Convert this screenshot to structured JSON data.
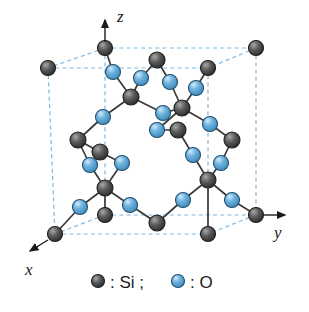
{
  "figure": {
    "background_color": "#ffffff"
  },
  "axes": {
    "x": {
      "label": "x",
      "direction": "down-left",
      "tip": [
        28,
        262
      ],
      "origin": [
        52,
        240
      ]
    },
    "y": {
      "label": "y",
      "direction": "right",
      "tip": [
        288,
        215
      ],
      "origin": [
        262,
        215
      ]
    },
    "z": {
      "label": "z",
      "direction": "up",
      "tip": [
        105,
        18
      ],
      "origin": [
        105,
        42
      ]
    }
  },
  "legend": {
    "si": {
      "symbol_color": "#4a4a4a",
      "label": ": Si ;"
    },
    "o": {
      "symbol_color": "#5aa8d8",
      "label": ": O"
    }
  },
  "colors": {
    "silicon": "#4a4a4a",
    "silicon_highlight": "#8e8e8e",
    "silicon_stroke": "#1f1f1f",
    "oxygen": "#5aa8d8",
    "oxygen_highlight": "#b8e0f5",
    "oxygen_stroke": "#1f4f70",
    "cell_edge": "#7fb8e0",
    "bond": "#3a3a3a"
  },
  "unit_cell": {
    "type": "dashed-cube",
    "edge_color": "#7fb8e0",
    "corners": {
      "back_top_left": [
        105,
        48
      ],
      "back_top_right": [
        256,
        48
      ],
      "front_top_left": [
        48,
        68
      ],
      "front_top_right": [
        208,
        68
      ],
      "back_bottom_left": [
        105,
        215
      ],
      "back_bottom_right": [
        256,
        215
      ],
      "front_bottom_left": [
        55,
        234
      ],
      "front_bottom_right": [
        208,
        234
      ]
    }
  },
  "atoms": {
    "silicon": [
      {
        "id": "si-corner-btl",
        "x": 105,
        "y": 48,
        "r": 7.5
      },
      {
        "id": "si-corner-btr",
        "x": 256,
        "y": 48,
        "r": 7.5
      },
      {
        "id": "si-corner-ftl",
        "x": 48,
        "y": 68,
        "r": 7.5
      },
      {
        "id": "si-corner-ftr",
        "x": 208,
        "y": 68,
        "r": 7.5
      },
      {
        "id": "si-corner-bbl",
        "x": 105,
        "y": 215,
        "r": 7.5
      },
      {
        "id": "si-corner-bbr",
        "x": 256,
        "y": 215,
        "r": 7.5
      },
      {
        "id": "si-corner-fbl",
        "x": 55,
        "y": 234,
        "r": 7.5
      },
      {
        "id": "si-corner-fbr",
        "x": 208,
        "y": 234,
        "r": 7.5
      },
      {
        "id": "si-top-mid",
        "x": 157,
        "y": 60,
        "r": 8
      },
      {
        "id": "si-upper-left",
        "x": 131,
        "y": 97,
        "r": 8
      },
      {
        "id": "si-upper-right",
        "x": 182,
        "y": 108,
        "r": 8
      },
      {
        "id": "si-mid-left",
        "x": 78,
        "y": 140,
        "r": 8
      },
      {
        "id": "si-mid-right",
        "x": 232,
        "y": 140,
        "r": 8
      },
      {
        "id": "si-center-upper",
        "x": 178,
        "y": 130,
        "r": 8
      },
      {
        "id": "si-center-left",
        "x": 100,
        "y": 152,
        "r": 8
      },
      {
        "id": "si-lower-left",
        "x": 105,
        "y": 188,
        "r": 8
      },
      {
        "id": "si-lower-right",
        "x": 208,
        "y": 180,
        "r": 8
      },
      {
        "id": "si-bottom-mid",
        "x": 157,
        "y": 223,
        "r": 8
      }
    ],
    "oxygen": [
      {
        "id": "o-1",
        "x": 113,
        "y": 72,
        "r": 7.5
      },
      {
        "id": "o-2",
        "x": 141,
        "y": 78,
        "r": 7.5
      },
      {
        "id": "o-3",
        "x": 170,
        "y": 82,
        "r": 7.5
      },
      {
        "id": "o-4",
        "x": 196,
        "y": 88,
        "r": 7.5
      },
      {
        "id": "o-5",
        "x": 163,
        "y": 113,
        "r": 7.5
      },
      {
        "id": "o-6",
        "x": 103,
        "y": 117,
        "r": 7.5
      },
      {
        "id": "o-7",
        "x": 210,
        "y": 124,
        "r": 7.5
      },
      {
        "id": "o-8",
        "x": 157,
        "y": 130,
        "r": 7.5
      },
      {
        "id": "o-9",
        "x": 90,
        "y": 165,
        "r": 7.5
      },
      {
        "id": "o-10",
        "x": 122,
        "y": 163,
        "r": 7.5
      },
      {
        "id": "o-11",
        "x": 193,
        "y": 155,
        "r": 7.5
      },
      {
        "id": "o-12",
        "x": 221,
        "y": 163,
        "r": 7.5
      },
      {
        "id": "o-13",
        "x": 80,
        "y": 207,
        "r": 7.5
      },
      {
        "id": "o-14",
        "x": 130,
        "y": 205,
        "r": 7.5
      },
      {
        "id": "o-15",
        "x": 183,
        "y": 200,
        "r": 7.5
      },
      {
        "id": "o-16",
        "x": 232,
        "y": 200,
        "r": 7.5
      }
    ]
  },
  "bonds": [
    [
      105,
      48,
      113,
      72
    ],
    [
      113,
      72,
      131,
      97
    ],
    [
      141,
      78,
      131,
      97
    ],
    [
      157,
      60,
      141,
      78
    ],
    [
      157,
      60,
      170,
      82
    ],
    [
      170,
      82,
      182,
      108
    ],
    [
      196,
      88,
      182,
      108
    ],
    [
      208,
      68,
      196,
      88
    ],
    [
      131,
      97,
      103,
      117
    ],
    [
      131,
      97,
      163,
      113
    ],
    [
      163,
      113,
      182,
      108
    ],
    [
      182,
      108,
      210,
      124
    ],
    [
      182,
      108,
      157,
      130
    ],
    [
      103,
      117,
      78,
      140
    ],
    [
      210,
      124,
      232,
      140
    ],
    [
      157,
      130,
      178,
      130
    ],
    [
      178,
      130,
      193,
      155
    ],
    [
      78,
      140,
      90,
      165
    ],
    [
      232,
      140,
      221,
      163
    ],
    [
      90,
      165,
      105,
      188
    ],
    [
      221,
      163,
      208,
      180
    ],
    [
      100,
      152,
      122,
      163
    ],
    [
      122,
      163,
      105,
      188
    ],
    [
      193,
      155,
      208,
      180
    ],
    [
      100,
      152,
      78,
      140
    ],
    [
      105,
      188,
      80,
      207
    ],
    [
      80,
      207,
      55,
      234
    ],
    [
      105,
      188,
      130,
      205
    ],
    [
      130,
      205,
      157,
      223
    ],
    [
      157,
      223,
      183,
      200
    ],
    [
      183,
      200,
      208,
      180
    ],
    [
      208,
      180,
      232,
      200
    ],
    [
      232,
      200,
      256,
      215
    ],
    [
      105,
      188,
      105,
      215
    ],
    [
      208,
      180,
      208,
      234
    ]
  ]
}
